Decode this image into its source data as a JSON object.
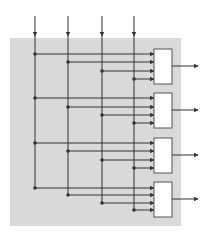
{
  "diagram": {
    "width": 209,
    "height": 236,
    "colors": {
      "background": "#ffffff",
      "region": "#d9d9d9",
      "line": "#333333",
      "box_fill": "#ffffff",
      "box_stroke": "#555555"
    },
    "region": {
      "x": 10,
      "y": 38,
      "w": 171,
      "h": 188
    },
    "inputs": [
      {
        "x": 35,
        "y_start": 16,
        "arrow_y": 36
      },
      {
        "x": 68,
        "y_start": 16,
        "arrow_y": 36
      },
      {
        "x": 102,
        "y_start": 16,
        "arrow_y": 36
      },
      {
        "x": 134,
        "y_start": 16,
        "arrow_y": 36
      }
    ],
    "boxes": [
      {
        "x": 154,
        "y": 49,
        "w": 18,
        "h": 35,
        "input_ys": [
          54,
          62,
          71,
          79
        ],
        "output_y": 66
      },
      {
        "x": 154,
        "y": 93,
        "w": 18,
        "h": 35,
        "input_ys": [
          98,
          107,
          115,
          123
        ],
        "output_y": 110
      },
      {
        "x": 154,
        "y": 138,
        "w": 18,
        "h": 35,
        "input_ys": [
          143,
          151,
          160,
          168
        ],
        "output_y": 155
      },
      {
        "x": 154,
        "y": 182,
        "w": 18,
        "h": 35,
        "input_ys": [
          188,
          195,
          203,
          210
        ],
        "output_y": 199
      }
    ],
    "output_arrow_end_x": 198,
    "node_radius": 1.8
  }
}
